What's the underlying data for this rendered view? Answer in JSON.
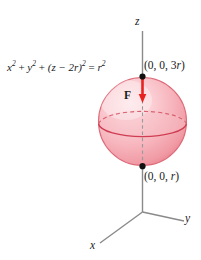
{
  "figure": {
    "equation": {
      "x_term": "x",
      "y_term": "y",
      "z_term": "(z − 2r)",
      "rhs": "r",
      "exp": "2",
      "plus": "+",
      "equals": "=",
      "full": "x² + y² + (z − 2r)² = r²"
    },
    "points": {
      "top": "(0, 0, 3r)",
      "top_prefix": "(0, 0, 3",
      "top_var": "r",
      "top_suffix": ")",
      "bottom": "(0, 0, r)",
      "bottom_prefix": "(0, 0, ",
      "bottom_var": "r",
      "bottom_suffix": ")"
    },
    "axes": {
      "z": "z",
      "y": "y",
      "x": "x"
    },
    "vector_label": "F",
    "colors": {
      "sphere_fill_light": "#fbd9dc",
      "sphere_fill_mid": "#f4a9b0",
      "sphere_rim": "#e8717f",
      "sphere_outline": "#d94f63",
      "arrow_red": "#e8231f",
      "axis_gray": "#8a8a8a",
      "dash_gray": "#9a9a9a",
      "dot_black": "#1a1a1a",
      "text": "#1a1a1a",
      "background": "#ffffff"
    }
  }
}
